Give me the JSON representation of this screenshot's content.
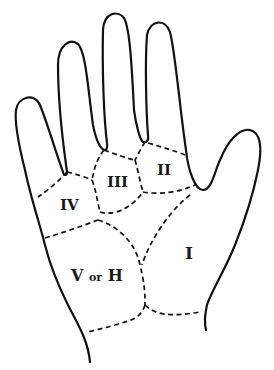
{
  "diagram": {
    "colors": {
      "ink": "#111111",
      "background": "#ffffff"
    },
    "regions": [
      {
        "id": "I",
        "label": "I"
      },
      {
        "id": "II",
        "label": "II"
      },
      {
        "id": "III",
        "label": "III"
      },
      {
        "id": "IV",
        "label": "IV"
      },
      {
        "id": "V",
        "label_main": "V",
        "label_conj": "or",
        "label_alt": "H"
      }
    ]
  }
}
